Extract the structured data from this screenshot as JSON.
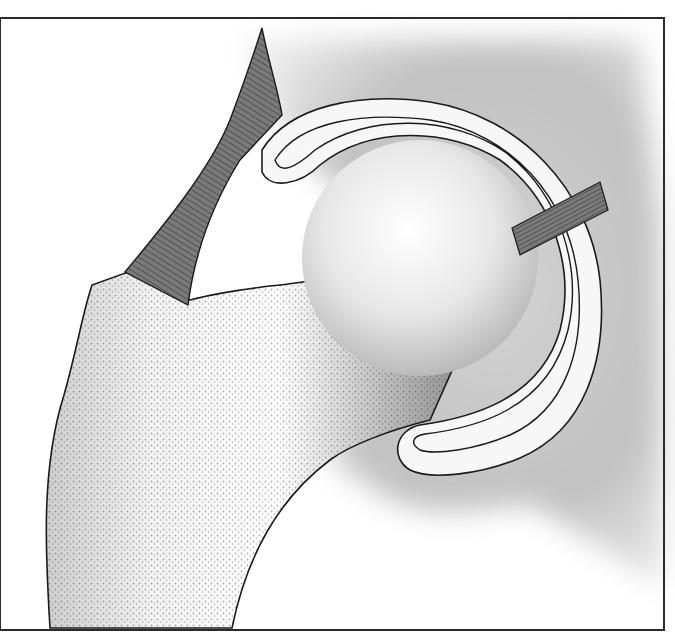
{
  "figure": {
    "title": "",
    "width": 675,
    "height": 637
  },
  "colors": {
    "background": "#ffffff",
    "frame": "#2a2a2a",
    "bone_light": "#f4f4f4",
    "bone_shade": "#9a9a9a",
    "tissue_shade": "#b8b8b8",
    "outline": "#1a1a1a",
    "muscle_fill": "#6e6e6e",
    "stipple": "#222222",
    "capsule_fill": "#f7f7f7"
  },
  "parts": {
    "frame": {
      "x": 0,
      "y": 18,
      "w": 664,
      "h": 612
    },
    "femur_outline": "M50,628 C46,560 40,470 64,395 C78,345 82,315 92,285 L128,272 L190,300 C220,292 240,290 270,286 C310,282 330,278 340,268 L420,240 L470,330 L430,420 C390,430 350,445 330,460 C290,490 250,540 232,628 Z",
    "pelvis_tissue": "M240,40 L640,40 L660,230 L664,590 C620,560 560,520 530,505 C480,510 420,520 380,495 C360,480 330,462 330,460 L420,240 L300,160 Z",
    "head_circle": {
      "cx": 420,
      "cy": 258,
      "r": 118
    },
    "capsule_outer": "M262,150 C290,105 360,92 430,102 C520,116 590,190 600,280 C608,360 585,430 520,458 C480,475 430,480 410,470 C390,458 395,430 420,425 C470,418 540,400 560,330 C575,270 555,200 500,160 C450,128 370,125 320,165 C300,185 270,190 262,172 Z",
    "capsule_inner": "M275,160 C300,120 365,112 430,120 C510,132 570,198 578,280 C585,350 565,410 510,435 C475,450 435,455 420,450 C410,444 412,436 425,434 C475,428 548,410 568,330 C582,270 562,195 505,152 C452,115 368,113 315,150 C295,168 280,175 275,160 Z",
    "muscle_main": "M262,28 C268,60 278,90 282,115 L240,160 C215,200 195,250 188,305 L125,272 C160,230 210,170 230,120 C245,80 255,50 262,28 Z",
    "ligament_right": "M512,228 L600,182 L608,210 L520,255 Z"
  }
}
